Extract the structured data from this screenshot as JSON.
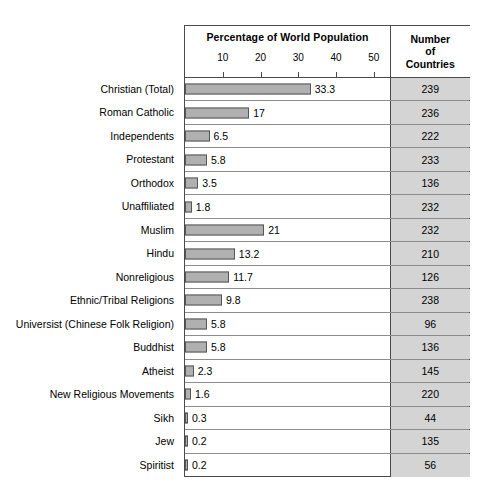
{
  "header": {
    "percentage_title": "Percentage of World Population",
    "countries_line1": "Number",
    "countries_line2": "of",
    "countries_line3": "Countries"
  },
  "chart_data": {
    "type": "bar",
    "orientation": "horizontal",
    "title": "Percentage of World Population",
    "xlabel": "",
    "ylabel": "",
    "xlim": [
      0,
      55
    ],
    "ticks": [
      10,
      20,
      30,
      40,
      50
    ],
    "grid": false,
    "legend": null,
    "bar_color": "#b0b0b0",
    "bar_border_color": "#555555",
    "count_cell_color": "#d4d4d4",
    "categories": [
      "Christian (Total)",
      "Roman Catholic",
      "Independents",
      "Protestant",
      "Orthodox",
      "Unaffiliated",
      "Muslim",
      "Hindu",
      "Nonreligious",
      "Ethnic/Tribal Religions",
      "Universist (Chinese Folk Religion)",
      "Buddhist",
      "Atheist",
      "New Religious Movements",
      "Sikh",
      "Jew",
      "Spiritist"
    ],
    "values": [
      33.3,
      17,
      6.5,
      5.8,
      3.5,
      1.8,
      21,
      13.2,
      11.7,
      9.8,
      5.8,
      5.8,
      2.3,
      1.6,
      0.3,
      0.2,
      0.2
    ],
    "value_labels": [
      "33.3",
      "17",
      "6.5",
      "5.8",
      "3.5",
      "1.8",
      "21",
      "13.2",
      "11.7",
      "9.8",
      "5.8",
      "5.8",
      "2.3",
      "1.6",
      "0.3",
      "0.2",
      "0.2"
    ],
    "series": [
      {
        "name": "Number of Countries",
        "values": [
          239,
          236,
          222,
          233,
          136,
          232,
          232,
          210,
          126,
          238,
          96,
          136,
          145,
          220,
          44,
          135,
          56
        ]
      }
    ]
  }
}
